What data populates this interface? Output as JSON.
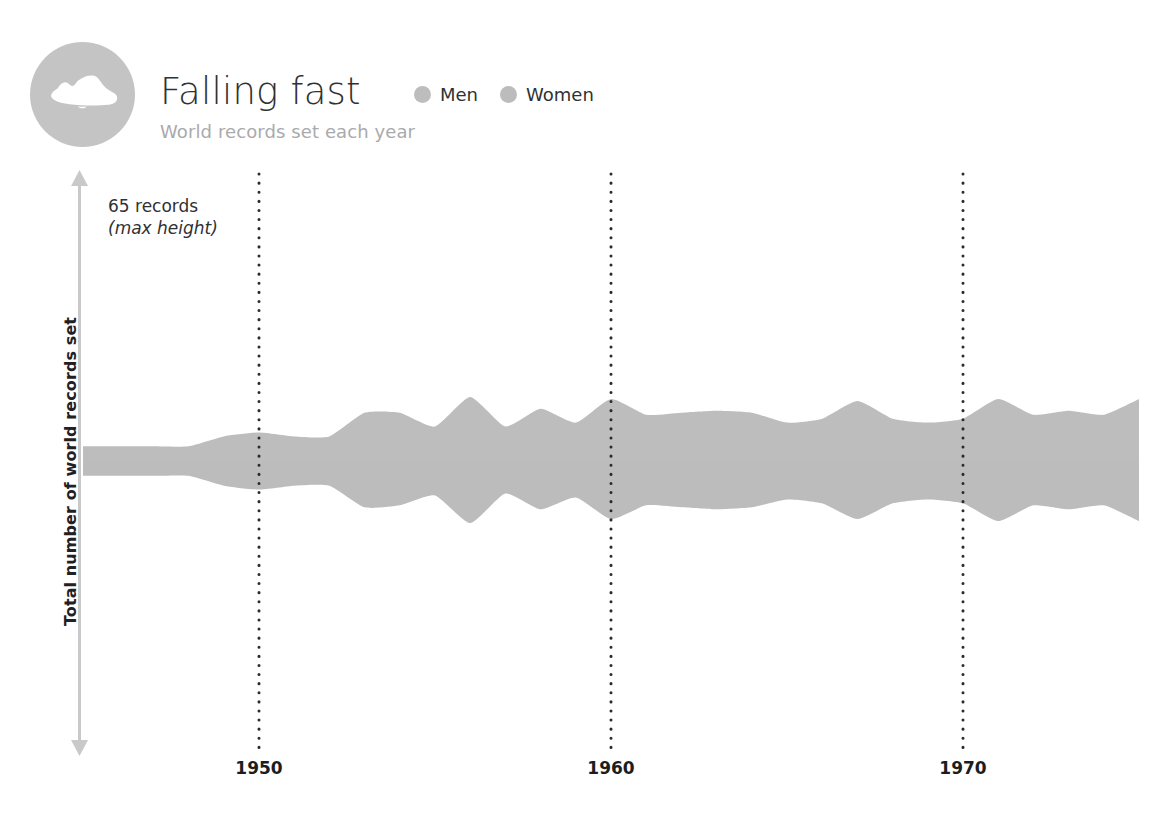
{
  "page": {
    "background": "#ffffff",
    "width": 1168,
    "height": 820,
    "cropped_top_text": ""
  },
  "header": {
    "badge_icon": "running-shoe-icon",
    "badge_color": "#c4c4c4",
    "title": "Falling fast",
    "subtitle": "World records set each year",
    "legend": [
      {
        "label": "Men",
        "color": "#bdbdbd"
      },
      {
        "label": "Women",
        "color": "#bcbcbc"
      }
    ]
  },
  "axes": {
    "y_label": "Total number of world records set",
    "y_arrow": "double-headed-vertical-arrow",
    "y_arrow_color": "#c9c9c9",
    "annotation_line1": "65 records",
    "annotation_line2": "(max height)",
    "x_tick_labels": [
      "1950",
      "1960",
      "1970"
    ],
    "gridline_color": "#2b2b2b",
    "gridline_style": "dotted"
  },
  "chart_data": {
    "type": "area",
    "variant": "streamgraph-symmetric",
    "title": "Falling fast",
    "subtitle": "World records set each year",
    "xlabel": "",
    "ylabel": "Total number of world records set",
    "annotation": "65 records (max height)",
    "ylim": [
      0,
      65
    ],
    "ymax_records": 65,
    "grid": "vertical-dotted-at-decades",
    "legend_position": "top",
    "x_tick_values": [
      1950,
      1960,
      1970
    ],
    "x": [
      1945,
      1946,
      1947,
      1948,
      1949,
      1950,
      1951,
      1952,
      1953,
      1954,
      1955,
      1956,
      1957,
      1958,
      1959,
      1960,
      1961,
      1962,
      1963,
      1964,
      1965,
      1966,
      1967,
      1968,
      1969,
      1970,
      1971,
      1972,
      1973,
      1974,
      1975
    ],
    "series": [
      {
        "name": "Men",
        "color": "#bdbdbd",
        "values": [
          8,
          8,
          8,
          8,
          13,
          15,
          13,
          13,
          25,
          25,
          18,
          33,
          18,
          27,
          20,
          32,
          24,
          25,
          26,
          25,
          20,
          22,
          31,
          22,
          20,
          22,
          32,
          24,
          26,
          24,
          32
        ]
      },
      {
        "name": "Women",
        "color": "#bcbcbc",
        "values": [
          7,
          7,
          7,
          7,
          12,
          14,
          12,
          12,
          23,
          22,
          17,
          31,
          16,
          24,
          18,
          29,
          22,
          23,
          24,
          23,
          19,
          21,
          29,
          21,
          19,
          21,
          30,
          22,
          24,
          22,
          30
        ]
      }
    ],
    "totals": [
      15,
      15,
      15,
      15,
      25,
      29,
      25,
      25,
      48,
      47,
      35,
      64,
      34,
      51,
      38,
      61,
      46,
      48,
      50,
      48,
      39,
      43,
      60,
      43,
      39,
      43,
      62,
      46,
      50,
      46,
      62
    ]
  }
}
